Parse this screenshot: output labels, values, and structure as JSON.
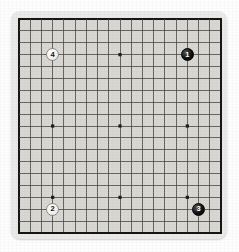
{
  "figure": {
    "name": "go-board-diagram",
    "board_size": 19,
    "colors": {
      "page_background": "#fdfdfd",
      "board_mat": "#e9e9e7",
      "board_surface": "#d8d7d2",
      "grid_line": "#4a4a4a",
      "border_line": "#151515",
      "star_point": "#1c1c1c",
      "black_stone": "#111111",
      "white_stone": "#f5f5f3"
    }
  },
  "board": {
    "size": 19,
    "star_points": [
      {
        "col": 3,
        "row": 3
      },
      {
        "col": 9,
        "row": 3
      },
      {
        "col": 15,
        "row": 3
      },
      {
        "col": 3,
        "row": 9
      },
      {
        "col": 9,
        "row": 9
      },
      {
        "col": 15,
        "row": 9
      },
      {
        "col": 3,
        "row": 15
      },
      {
        "col": 9,
        "row": 15
      },
      {
        "col": 15,
        "row": 15
      }
    ]
  },
  "stones": [
    {
      "label": "1",
      "color": "black",
      "col": 15,
      "row": 3,
      "name": "stone-1-black"
    },
    {
      "label": "2",
      "color": "white",
      "col": 3,
      "row": 16,
      "name": "stone-2-white"
    },
    {
      "label": "3",
      "color": "black",
      "col": 16,
      "row": 16,
      "name": "stone-3-black"
    },
    {
      "label": "4",
      "color": "white",
      "col": 3,
      "row": 3,
      "name": "stone-4-white"
    }
  ]
}
